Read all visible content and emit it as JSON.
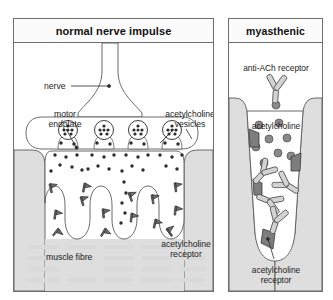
{
  "panels": [
    {
      "id": "normal",
      "title": "normal nerve impulse",
      "labels": {
        "nerve": "nerve",
        "motor_endplate": "motor\nendplate",
        "motor_endplate_line1": "motor",
        "motor_endplate_line2": "endplate",
        "vesicles_line1": "acetylcholine",
        "vesicles_line2": "vesicles",
        "muscle_fibre": "muscle fibre",
        "receptor_line1": "acetylcholine",
        "receptor_line2": "receptor"
      },
      "counts": {
        "vesicles_fusing": 4,
        "junctional_folds": 4,
        "receptor_flags": 14
      }
    },
    {
      "id": "myasthenic",
      "title": "myasthenic",
      "labels": {
        "antibody_line1": "anti-ACh receptor",
        "acetylcholine": "acetylcholine",
        "receptor_line1": "acetylcholine",
        "receptor_line2": "receptor"
      },
      "counts": {
        "antibodies": 5,
        "acetylcholine_molecules": 9,
        "blocked_receptors": 4
      }
    }
  ],
  "colors": {
    "outline": "#5a5a5a",
    "panel_border": "#6e6e6e",
    "muscle_gray": "#dedede",
    "receptor_gray": "#7d7d7d",
    "antibody_gray": "#d3d3d3",
    "ach_dot": "#8a8a8a",
    "striation": "#d9d9d9",
    "background": "#ffffff",
    "text": "#1b1b1b"
  }
}
